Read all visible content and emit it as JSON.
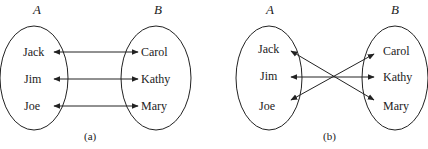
{
  "diagrams": [
    {
      "id": "a",
      "caption": "(a)",
      "set_a": {
        "label": "A",
        "elements": [
          "Jack",
          "Jim",
          "Joe"
        ]
      },
      "set_b": {
        "label": "B",
        "elements": [
          "Carol",
          "Kathy",
          "Mary"
        ]
      },
      "mappings": [
        {
          "from": "Jack",
          "to": "Carol"
        },
        {
          "from": "Jim",
          "to": "Kathy"
        },
        {
          "from": "Joe",
          "to": "Mary"
        }
      ]
    },
    {
      "id": "b",
      "caption": "(b)",
      "set_a": {
        "label": "A",
        "elements": [
          "Jack",
          "Jim",
          "Joe"
        ]
      },
      "set_b": {
        "label": "B",
        "elements": [
          "Carol",
          "Kathy",
          "Mary"
        ]
      },
      "mappings": [
        {
          "from": "Jack",
          "to": "Mary"
        },
        {
          "from": "Jim",
          "to": "Kathy"
        },
        {
          "from": "Joe",
          "to": "Carol"
        }
      ]
    }
  ]
}
